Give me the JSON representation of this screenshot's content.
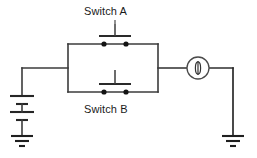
{
  "diagram": {
    "type": "electrical-schematic",
    "background_color": "#ffffff",
    "line_color": "#3b3b3b",
    "text_color": "#1a1a1a",
    "labels": {
      "switch_a": "Switch A",
      "switch_b": "Switch B"
    },
    "components": [
      {
        "id": "battery",
        "name": "battery",
        "symbol": "two-cell-battery",
        "position": "left",
        "cells": 2
      },
      {
        "id": "ground-left",
        "name": "ground",
        "symbol": "earth-ground",
        "position": "bottom-left",
        "bars": 3
      },
      {
        "id": "switch-a",
        "name": "switch-a",
        "symbol": "push-button-normally-open",
        "label": "Switch A",
        "position": "top-branch",
        "state": "open"
      },
      {
        "id": "switch-b",
        "name": "switch-b",
        "symbol": "push-button-normally-open",
        "label": "Switch B",
        "position": "bottom-branch",
        "state": "open"
      },
      {
        "id": "lamp",
        "name": "lamp",
        "symbol": "lamp-indicator",
        "position": "right",
        "state": "off"
      },
      {
        "id": "ground-right",
        "name": "ground",
        "symbol": "earth-ground",
        "position": "bottom-right",
        "bars": 3
      }
    ]
  }
}
